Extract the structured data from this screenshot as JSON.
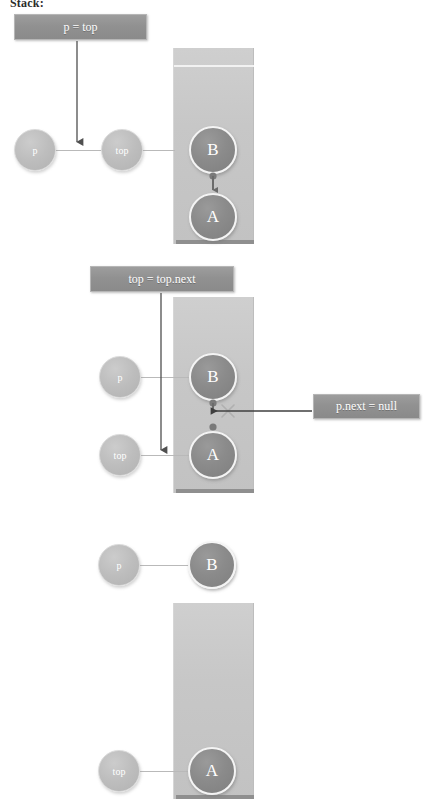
{
  "page": {
    "title": "Stack:",
    "background": "#ffffff",
    "width": 423,
    "height": 803
  },
  "colors": {
    "stack_fill": "#c7c7c7",
    "stack_base": "#8f8f8f",
    "data_node_fill": "#8b8b8b",
    "pointer_node_fill": "#bdbdbd",
    "label_fill": "#919191",
    "label_text": "#ffffff",
    "arrow": "#4f4f4f",
    "link_line": "#b9b9b9",
    "cross_mark": "#b0b0b0"
  },
  "steps": [
    {
      "id": "step-1",
      "annotation": {
        "text": "p = top"
      },
      "stack": {
        "label": "stack-container"
      },
      "pointers": [
        {
          "name": "p",
          "label": "p"
        },
        {
          "name": "top",
          "label": "top"
        }
      ],
      "nodes": [
        {
          "name": "node-b",
          "label": "B"
        },
        {
          "name": "node-a",
          "label": "A"
        }
      ]
    },
    {
      "id": "step-2",
      "annotations": [
        {
          "text": "top = top.next"
        },
        {
          "text": "p.next = null"
        }
      ],
      "stack": {
        "label": "stack-container"
      },
      "pointers": [
        {
          "name": "p",
          "label": "p"
        },
        {
          "name": "top",
          "label": "top"
        }
      ],
      "nodes": [
        {
          "name": "node-b",
          "label": "B"
        },
        {
          "name": "node-a",
          "label": "A"
        }
      ]
    },
    {
      "id": "step-3",
      "stack": {
        "label": "stack-container"
      },
      "detached": [
        {
          "name": "p",
          "label": "p"
        },
        {
          "name": "node-b",
          "label": "B"
        }
      ],
      "pointers": [
        {
          "name": "top",
          "label": "top"
        }
      ],
      "nodes": [
        {
          "name": "node-a",
          "label": "A"
        }
      ]
    }
  ],
  "labels": {
    "p": "p",
    "top": "top",
    "node_b": "B",
    "node_a": "A",
    "anno_p_eq_top": "p = top",
    "anno_top_eq_topnext": "top = top.next",
    "anno_pnext_null": "p.next = null"
  }
}
